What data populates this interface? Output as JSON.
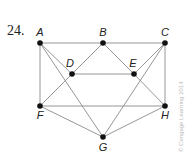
{
  "problem_number": "24.",
  "credit": "© Cengage Learning 2014",
  "colors": {
    "edge": "#8a8a8a",
    "vertex": "#111111"
  },
  "graph": {
    "vertices": [
      {
        "id": "A",
        "label": "A",
        "x": 40,
        "y": 43,
        "lx": 40,
        "ly": 36
      },
      {
        "id": "B",
        "label": "B",
        "x": 103,
        "y": 43,
        "lx": 103,
        "ly": 36
      },
      {
        "id": "C",
        "label": "C",
        "x": 165,
        "y": 43,
        "lx": 165,
        "ly": 36
      },
      {
        "id": "D",
        "label": "D",
        "x": 72,
        "y": 74,
        "lx": 70,
        "ly": 67
      },
      {
        "id": "E",
        "label": "E",
        "x": 134,
        "y": 74,
        "lx": 133,
        "ly": 67
      },
      {
        "id": "F",
        "label": "F",
        "x": 40,
        "y": 106,
        "lx": 40,
        "ly": 119
      },
      {
        "id": "G",
        "label": "G",
        "x": 103,
        "y": 137,
        "lx": 103,
        "ly": 151
      },
      {
        "id": "H",
        "label": "H",
        "x": 165,
        "y": 106,
        "lx": 165,
        "ly": 119
      }
    ],
    "edges": [
      [
        "A",
        "B"
      ],
      [
        "B",
        "C"
      ],
      [
        "A",
        "F"
      ],
      [
        "C",
        "H"
      ],
      [
        "A",
        "D"
      ],
      [
        "A",
        "G"
      ],
      [
        "B",
        "D"
      ],
      [
        "B",
        "E"
      ],
      [
        "D",
        "E"
      ],
      [
        "D",
        "F"
      ],
      [
        "E",
        "H"
      ],
      [
        "E",
        "C"
      ],
      [
        "C",
        "G"
      ],
      [
        "F",
        "H"
      ],
      [
        "F",
        "G"
      ],
      [
        "G",
        "H"
      ]
    ]
  }
}
